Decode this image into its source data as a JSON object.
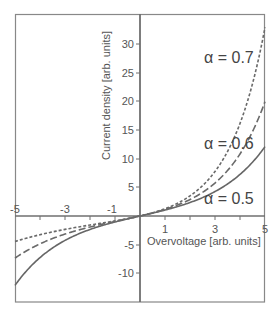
{
  "chart_data": {
    "type": "line",
    "title": "",
    "xlabel": "Overvoltage [arb. units]",
    "ylabel": "Current density [arb. units]",
    "xlim": [
      -5,
      5
    ],
    "ylim": [
      -15,
      35
    ],
    "x_ticks": [
      -5,
      -3,
      -1,
      1,
      3,
      5
    ],
    "x_tick_labels": [
      "-5",
      "-3",
      "-1",
      "1",
      "3",
      "5"
    ],
    "y_ticks": [
      -10,
      -5,
      5,
      10,
      15,
      20,
      25,
      30
    ],
    "y_tick_labels": [
      "-10",
      "-5",
      "5",
      "10",
      "15",
      "20",
      "25",
      "30"
    ],
    "grid": false,
    "legend": "inline labels",
    "x": [
      -5,
      -4,
      -3,
      -2,
      -1,
      0,
      1,
      2,
      3,
      4,
      5
    ],
    "series": [
      {
        "name": "α = 0.5",
        "style": "solid",
        "values": [
          -12.1,
          -7.25,
          -4.26,
          -2.35,
          -1.04,
          0,
          1.04,
          2.35,
          4.26,
          7.25,
          12.1
        ]
      },
      {
        "name": "α = 0.6",
        "style": "long-dash",
        "values": [
          -7.34,
          -4.86,
          -3.15,
          -1.93,
          -0.94,
          0,
          1.15,
          2.87,
          5.5,
          10.57,
          19.95
        ]
      },
      {
        "name": "α = 0.7",
        "style": "short-dash",
        "values": [
          -4.45,
          -3.26,
          -2.34,
          -1.58,
          -0.85,
          0,
          1.27,
          3.51,
          7.76,
          16.15,
          32.9
        ]
      }
    ],
    "annotations": [
      "α = 0.7",
      "α = 0.6",
      "α = 0.5"
    ]
  },
  "labels": {
    "xlabel": "Overvoltage [arb. units]",
    "ylabel": "Current density [arb. units]",
    "alpha07": "α = 0.7",
    "alpha06": "α = 0.6",
    "alpha05": "α = 0.5",
    "xt_m5": "-5",
    "xt_m3": "-3",
    "xt_m1": "-1",
    "xt_1": "1",
    "xt_3": "3",
    "xt_5": "5",
    "yt_30": "30",
    "yt_25": "25",
    "yt_20": "20",
    "yt_15": "15",
    "yt_10": "10",
    "yt_5": "5",
    "yt_m5": "-5",
    "yt_m10": "-10"
  },
  "colors": {
    "axis": "#777777",
    "curve": "#666666",
    "text": "#555555"
  }
}
